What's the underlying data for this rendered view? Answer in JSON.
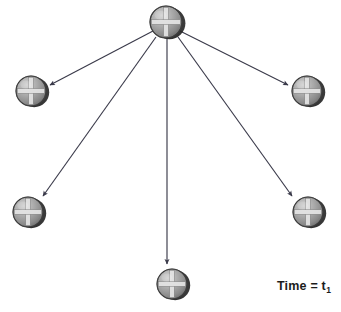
{
  "figure": {
    "title": "",
    "background_color": "#ffffff",
    "width": 341,
    "height": 312,
    "time_label": {
      "prefix": "Time = t",
      "subscript": "1",
      "full_text": "Time = t1",
      "x": 277,
      "y": 280,
      "color": "#1c1c1c"
    },
    "arrow_color": "#3a3a4a",
    "node_style": {
      "fill_light": "#b9b9b9",
      "fill_mid": "#8f8f8f",
      "fill_dark": "#5a5a5a",
      "shadow_color": "#1a1a1a",
      "cross_color": "#e8e8e8",
      "outline_color": "#3a3a3a"
    },
    "nodes": [
      {
        "id": "center-node",
        "label": "center node",
        "cx": 166,
        "cy": 22,
        "r": 16
      },
      {
        "id": "node-upper-left",
        "label": "upper left node",
        "cx": 31,
        "cy": 91,
        "r": 15
      },
      {
        "id": "node-upper-right",
        "label": "upper right node",
        "cx": 307,
        "cy": 91,
        "r": 15
      },
      {
        "id": "node-lower-left",
        "label": "lower left node",
        "cx": 28,
        "cy": 212,
        "r": 15
      },
      {
        "id": "node-lower-right",
        "label": "lower right node",
        "cx": 308,
        "cy": 212,
        "r": 15
      },
      {
        "id": "node-bottom",
        "label": "bottom node",
        "cx": 172,
        "cy": 284,
        "r": 15
      }
    ],
    "arrows": [
      {
        "id": "arrow-to-upper-left",
        "from": "center-node",
        "to": "node-upper-left",
        "x1": 153,
        "y1": 31,
        "x2": 50,
        "y2": 85
      },
      {
        "id": "arrow-to-upper-right",
        "from": "center-node",
        "to": "node-upper-right",
        "x1": 180,
        "y1": 31,
        "x2": 288,
        "y2": 85
      },
      {
        "id": "arrow-to-lower-left",
        "from": "center-node",
        "to": "node-lower-left",
        "x1": 156,
        "y1": 37,
        "x2": 43,
        "y2": 196
      },
      {
        "id": "arrow-to-lower-right",
        "from": "center-node",
        "to": "node-lower-right",
        "x1": 178,
        "y1": 37,
        "x2": 292,
        "y2": 196
      },
      {
        "id": "arrow-to-bottom",
        "from": "center-node",
        "to": "node-bottom",
        "x1": 167,
        "y1": 38,
        "x2": 167,
        "y2": 264
      }
    ]
  }
}
